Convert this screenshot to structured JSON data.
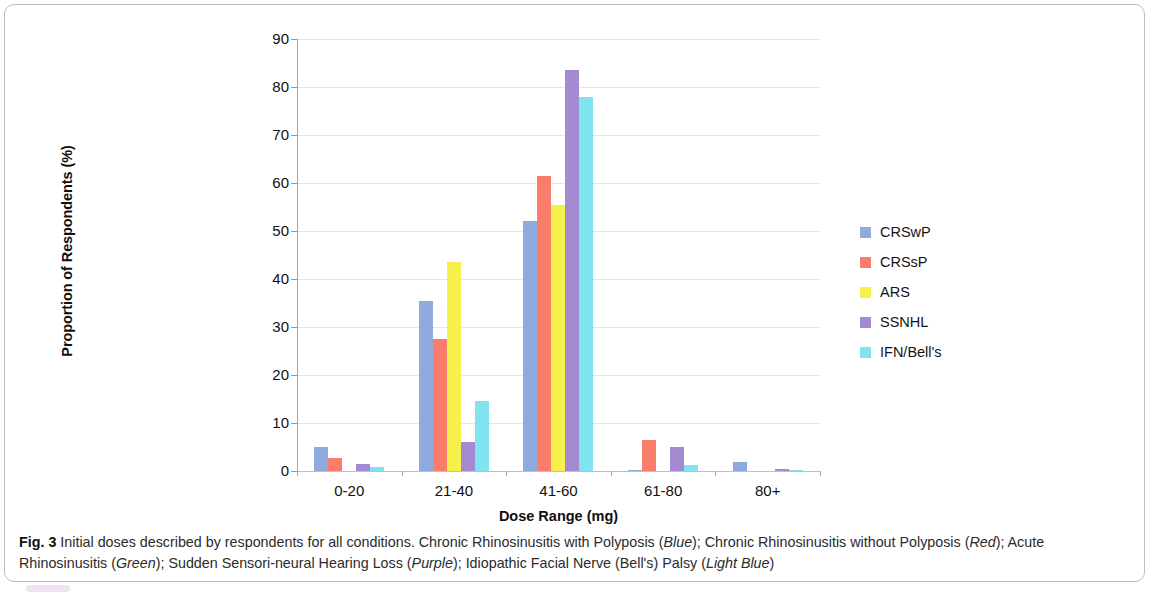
{
  "figure": {
    "caption_label": "Fig. 3",
    "caption_text_1": " Initial doses described by respondents for all conditions. Chronic Rhinosinusitis with Polyposis (",
    "caption_em_1": "Blue",
    "caption_text_2": "); Chronic Rhinosinusitis without Polyposis (",
    "caption_em_2": "Red",
    "caption_text_3": "); Acute Rhinosinusitis (",
    "caption_em_3": "Green",
    "caption_text_4": "); Sudden Sensori-neural Hearing Loss (",
    "caption_em_4": "Purple",
    "caption_text_5": "); Idiopathic Facial Nerve (Bell's) Palsy (",
    "caption_em_5": "Light Blue",
    "caption_text_6": ")"
  },
  "chart_data": {
    "type": "bar",
    "title": "",
    "xlabel": "Dose Range (mg)",
    "ylabel": "Proportion of Respondents (%)",
    "categories": [
      "0-20",
      "21-40",
      "41-60",
      "61-80",
      "80+"
    ],
    "ylim": [
      0,
      90
    ],
    "yticks": [
      0,
      10,
      20,
      30,
      40,
      50,
      60,
      70,
      80,
      90
    ],
    "grid": true,
    "legend_position": "right",
    "series": [
      {
        "name": "CRSwP",
        "color": "#8faadc",
        "values": [
          5.0,
          35.5,
          52.0,
          0.3,
          1.8
        ]
      },
      {
        "name": "CRSsP",
        "color": "#fa7d6b",
        "values": [
          2.8,
          27.5,
          61.5,
          6.5,
          0.0
        ]
      },
      {
        "name": "ARS",
        "color": "#f5f04a",
        "values": [
          0.0,
          43.5,
          55.5,
          0.0,
          0.0
        ]
      },
      {
        "name": "SSNHL",
        "color": "#a38ad1",
        "values": [
          1.5,
          6.0,
          83.5,
          5.0,
          0.4
        ]
      },
      {
        "name": "IFN/Bell's",
        "color": "#7fe3f0",
        "values": [
          0.9,
          14.5,
          78.0,
          1.2,
          0.2
        ]
      }
    ]
  }
}
